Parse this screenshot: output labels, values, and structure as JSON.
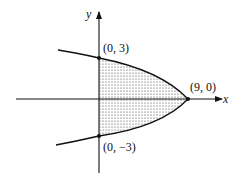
{
  "diagram": {
    "type": "region-between-curve-and-axis",
    "axes": {
      "x_label": "x",
      "y_label": "y"
    },
    "points": [
      {
        "id": "top",
        "label": "(0, 3)",
        "x": 0,
        "y": 3
      },
      {
        "id": "vertex",
        "label": "(9, 0)",
        "x": 9,
        "y": 0
      },
      {
        "id": "bottom",
        "label": "(0, −3)",
        "x": 0,
        "y": -3
      }
    ],
    "curve": {
      "equation": "x = 9 - y^2",
      "shape": "parabola opening left"
    },
    "shading": {
      "pattern": "dotted stipple",
      "region": "between parabola and y-axis, 0 <= x <= 9 - y^2"
    },
    "colors": {
      "ink": "#111111",
      "background": "#ffffff"
    }
  }
}
